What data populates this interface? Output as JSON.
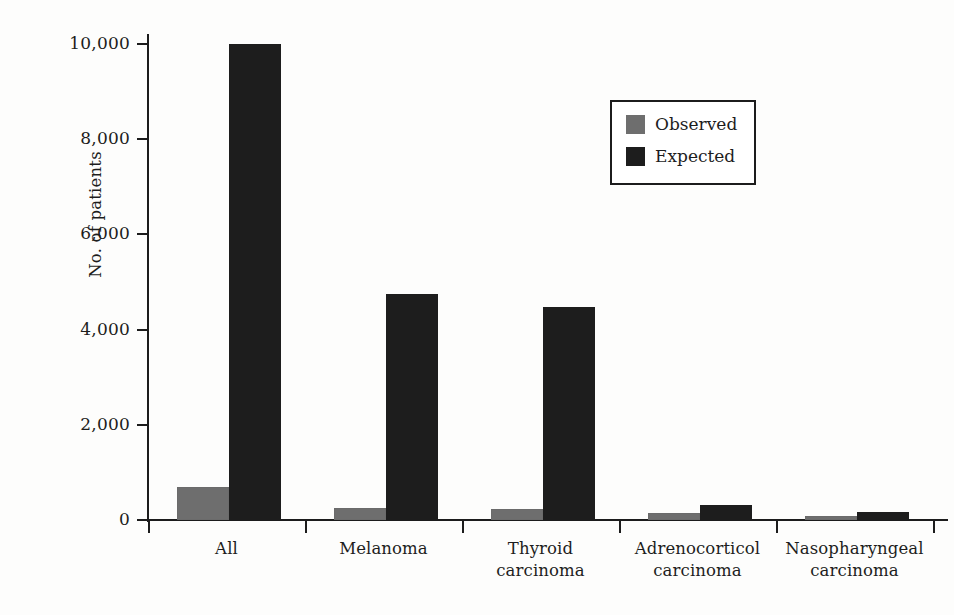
{
  "chart_data": {
    "type": "bar",
    "title": "",
    "xlabel": "",
    "ylabel": "No. of patients",
    "ylim": [
      0,
      10000
    ],
    "yticks": [
      0,
      2000,
      4000,
      6000,
      8000,
      10000
    ],
    "ytick_labels": [
      "0",
      "2,000",
      "4,000",
      "6,000",
      "8,000",
      "10,000"
    ],
    "grid": false,
    "legend_position": "upper right",
    "categories": [
      "All",
      "Melanoma",
      "Thyroid carcinoma",
      "Adrenocorticol carcinoma",
      "Nasopharyngeal carcinoma"
    ],
    "category_lines": [
      [
        "All",
        ""
      ],
      [
        "Melanoma",
        ""
      ],
      [
        "Thyroid",
        "carcinoma"
      ],
      [
        "Adrenocorticol",
        "carcinoma"
      ],
      [
        "Nasopharyngeal",
        "carcinoma"
      ]
    ],
    "series": [
      {
        "name": "Observed",
        "color": "#6e6e6e",
        "values": [
          700,
          250,
          240,
          150,
          90
        ]
      },
      {
        "name": "Expected",
        "color": "#1d1d1d",
        "values": [
          10000,
          4750,
          4480,
          320,
          170
        ]
      }
    ]
  },
  "legend": {
    "items": [
      {
        "label": "Observed",
        "swatch": "observed"
      },
      {
        "label": "Expected",
        "swatch": "expected"
      }
    ]
  },
  "axis": {
    "y_title": "No. of patients"
  }
}
